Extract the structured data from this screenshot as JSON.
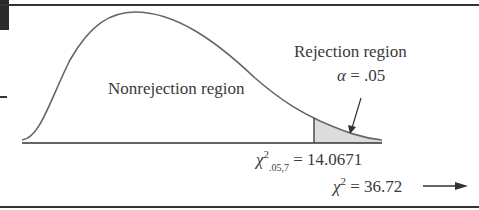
{
  "figure": {
    "nonrejection_label": "Nonrejection region",
    "rejection_label": "Rejection region",
    "alpha_symbol": "α",
    "alpha_eq": "= .05",
    "critical_symbol": "χ",
    "critical_sup": "2",
    "critical_sub": ".05,7",
    "critical_eq": "= 14.0671",
    "observed_symbol": "χ",
    "observed_sup": "2",
    "observed_eq": "= 36.72"
  },
  "colors": {
    "curve": "#666666",
    "shade": "#dcdcdc",
    "frame": "#333333"
  }
}
